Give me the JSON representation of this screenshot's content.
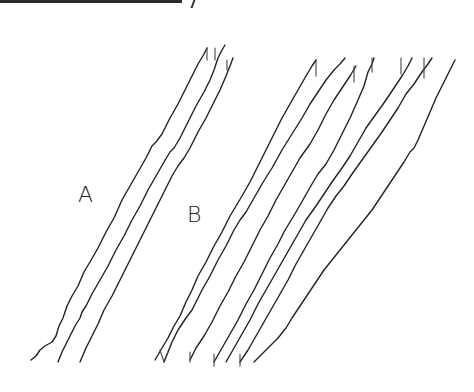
{
  "figure": {
    "group_a": {
      "label": "A",
      "trace_count": 3
    },
    "group_b": {
      "label": "B",
      "trace_count": 7
    },
    "colors": {
      "background": "#ffffff",
      "ink": "#222222"
    }
  }
}
